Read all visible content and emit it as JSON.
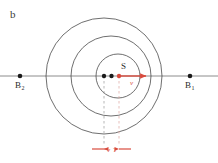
{
  "figure": {
    "panel_label": "b",
    "background_color": "#ffffff",
    "line_color": "#4a4a4a",
    "axis_color": "#6e6e6e",
    "accent_color": "#d94b3e",
    "dot_color": "#1a1a1a"
  },
  "axis": {
    "name": "horizontal-axis",
    "y": 76,
    "x_start": 0,
    "x_end": 218
  },
  "observers": [
    {
      "id": "B2",
      "label": "B",
      "subscript": "2",
      "x": 20,
      "y": 76,
      "label_x": 15,
      "label_y": 88,
      "sub_x": 22,
      "sub_y": 90
    },
    {
      "id": "B1",
      "label": "B",
      "subscript": "1",
      "x": 190,
      "y": 76,
      "label_x": 185,
      "label_y": 88,
      "sub_x": 192,
      "sub_y": 90
    }
  ],
  "wavefronts": [
    {
      "id": "outer-wavefront",
      "cx": 104,
      "cy": 76,
      "r": 58
    },
    {
      "id": "middle-wavefront",
      "cx": 111,
      "cy": 76,
      "r": 40
    },
    {
      "id": "inner-wavefront",
      "cx": 118,
      "cy": 76,
      "r": 22
    }
  ],
  "centers": [
    {
      "id": "center-dot-outer",
      "x": 104,
      "y": 76
    },
    {
      "id": "center-dot-middle",
      "x": 111,
      "y": 76
    }
  ],
  "source": {
    "label": "S",
    "x": 119,
    "y": 76,
    "label_x": 122,
    "label_y": 68
  },
  "velocity_vector": {
    "label": "v",
    "x_start": 119,
    "x_end": 148,
    "y": 76,
    "label_x": 132,
    "label_y": 85
  },
  "drop_lines": [
    {
      "id": "drop-line-left",
      "x": 104,
      "y_start": 76,
      "y_end": 146
    },
    {
      "id": "drop-line-right",
      "x": 119,
      "y_start": 76,
      "y_end": 146
    }
  ],
  "dimension": {
    "label": "vT",
    "label_text_v": "v",
    "label_text_T": "T",
    "y": 149,
    "x_left": 104,
    "x_right": 119,
    "tail_left": 92,
    "tail_right": 131,
    "label_x": 111,
    "label_y": 152
  }
}
